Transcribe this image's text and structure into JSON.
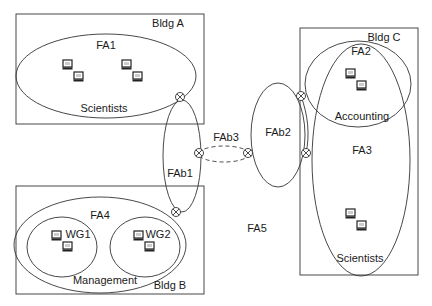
{
  "buildings": [
    {
      "id": "bldg-a",
      "label": "Bldg A",
      "x": 16,
      "y": 14,
      "w": 188,
      "h": 110,
      "lx": 168,
      "ly": 27
    },
    {
      "id": "bldg-b",
      "label": "Bldg B",
      "x": 16,
      "y": 186,
      "w": 188,
      "h": 108,
      "lx": 170,
      "ly": 289
    },
    {
      "id": "bldg-c",
      "label": "Bldg C",
      "x": 300,
      "y": 28,
      "w": 118,
      "h": 247,
      "lx": 384,
      "ly": 41
    }
  ],
  "areas": [
    {
      "id": "fa1",
      "label": "FA1",
      "cx": 106,
      "cy": 76,
      "rx": 90,
      "ry": 42,
      "lx": 106,
      "ly": 49
    },
    {
      "id": "fa1-group",
      "label": "Scientists",
      "cx": 0,
      "cy": 0,
      "rx": 0,
      "ry": 0,
      "lx": 104,
      "ly": 112
    },
    {
      "id": "fa4",
      "label": "FA4",
      "cx": 100,
      "cy": 245,
      "rx": 86,
      "ry": 48,
      "lx": 100,
      "ly": 219
    },
    {
      "id": "fa4-group",
      "label": "Management",
      "cx": 0,
      "cy": 0,
      "rx": 0,
      "ry": 0,
      "lx": 105,
      "ly": 284
    },
    {
      "id": "wg1",
      "label": "WG1",
      "cx": 62,
      "cy": 247,
      "rx": 35,
      "ry": 30,
      "lx": 78,
      "ly": 238
    },
    {
      "id": "wg2",
      "label": "WG2",
      "cx": 145,
      "cy": 247,
      "rx": 35,
      "ry": 30,
      "lx": 158,
      "ly": 238
    },
    {
      "id": "fab1",
      "label": "FAb1",
      "cx": 182,
      "cy": 156,
      "rx": 19,
      "ry": 56,
      "lx": 180,
      "ly": 177
    },
    {
      "id": "fab2",
      "label": "FAb2",
      "cx": 278,
      "cy": 135,
      "rx": 27,
      "ry": 52,
      "lx": 278,
      "ly": 136
    },
    {
      "id": "fab3",
      "label": "FAb3",
      "cx": 224,
      "cy": 154,
      "rx": 25,
      "ry": 8,
      "lx": 226,
      "ly": 141
    },
    {
      "id": "fa2",
      "label": "FA2",
      "cx": 358,
      "cy": 84,
      "rx": 53,
      "ry": 43,
      "lx": 361,
      "ly": 55
    },
    {
      "id": "fa2-group",
      "label": "Accounting",
      "cx": 0,
      "cy": 0,
      "rx": 0,
      "ry": 0,
      "lx": 362,
      "ly": 120
    },
    {
      "id": "fa3",
      "label": "FA3",
      "cx": 361,
      "cy": 160,
      "rx": 49,
      "ry": 116,
      "lx": 362,
      "ly": 154
    },
    {
      "id": "fa3-group",
      "label": "Scientists",
      "cx": 0,
      "cy": 0,
      "rx": 0,
      "ry": 0,
      "lx": 360,
      "ly": 262
    },
    {
      "id": "fa5",
      "label": "FA5",
      "cx": 0,
      "cy": 0,
      "rx": 0,
      "ry": 0,
      "lx": 257,
      "ly": 232
    }
  ],
  "connectors": [
    {
      "x": 180,
      "y": 97
    },
    {
      "x": 176,
      "y": 212
    },
    {
      "x": 199,
      "y": 153
    },
    {
      "x": 248,
      "y": 153
    },
    {
      "x": 301,
      "y": 96
    },
    {
      "x": 306,
      "y": 153
    }
  ],
  "computers": [
    {
      "x": 63,
      "y": 60
    },
    {
      "x": 74,
      "y": 72
    },
    {
      "x": 122,
      "y": 60
    },
    {
      "x": 133,
      "y": 72
    },
    {
      "x": 52,
      "y": 231
    },
    {
      "x": 63,
      "y": 242
    },
    {
      "x": 134,
      "y": 231
    },
    {
      "x": 145,
      "y": 242
    },
    {
      "x": 346,
      "y": 69
    },
    {
      "x": 357,
      "y": 81
    },
    {
      "x": 346,
      "y": 209
    },
    {
      "x": 357,
      "y": 221
    }
  ]
}
